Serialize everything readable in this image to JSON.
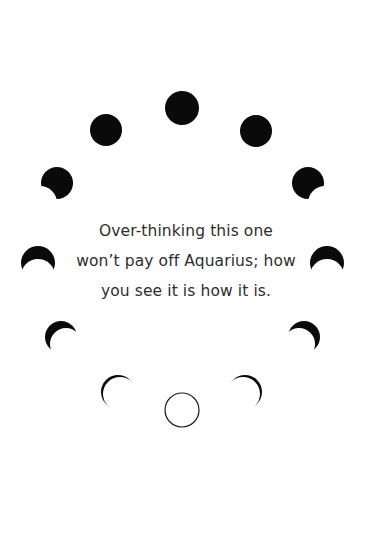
{
  "card": {
    "sign": "Aquarius",
    "message_lines": [
      "Over-thinking this one",
      "won’t pay off Aquarius; how",
      "you see it is how it is."
    ]
  },
  "moon_phases": [
    {
      "name": "full-moon",
      "cx": 182,
      "cy": 108
    },
    {
      "name": "waning-gibbous-left",
      "cx": 106,
      "cy": 130
    },
    {
      "name": "waxing-gibbous-right",
      "cx": 256,
      "cy": 131
    },
    {
      "name": "last-quarter-left",
      "cx": 57,
      "cy": 183
    },
    {
      "name": "first-quarter-right",
      "cx": 308,
      "cy": 183
    },
    {
      "name": "crescent-left",
      "cx": 38,
      "cy": 262
    },
    {
      "name": "crescent-right",
      "cx": 327,
      "cy": 262
    },
    {
      "name": "thin-crescent-left",
      "cx": 61,
      "cy": 337
    },
    {
      "name": "thin-crescent-right",
      "cx": 304,
      "cy": 337
    },
    {
      "name": "thinnest-crescent-left",
      "cx": 117,
      "cy": 392
    },
    {
      "name": "thinnest-crescent-right",
      "cx": 246,
      "cy": 392
    },
    {
      "name": "new-moon",
      "cx": 182,
      "cy": 410
    }
  ],
  "colors": {
    "background": "#ffffff",
    "moon": "#0a0a0a",
    "text": "#2e2e2e"
  }
}
